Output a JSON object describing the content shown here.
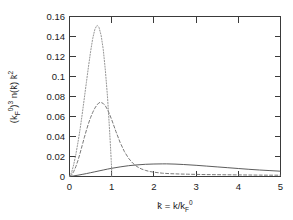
{
  "chart_data": {
    "type": "line",
    "title": "",
    "subtitle": "",
    "xlabel": "k̄ = k/k_F^0",
    "xlabel_parts": {
      "var": "k̄",
      "equals": " = k/k",
      "sub": "F",
      "sup": "0"
    },
    "ylabel": "(k_F^0)^3 n(k̄) k̄^2",
    "ylabel_parts": {
      "open": "(k",
      "sub1": "F",
      "sup1": "0",
      "close": ")",
      "sup2": "3",
      "mid": " n(k̄) k̄",
      "sup3": "2"
    },
    "xlim": [
      0,
      5
    ],
    "ylim": [
      0,
      0.16
    ],
    "xticks": [
      "0",
      "1",
      "2",
      "3",
      "4",
      "5"
    ],
    "xtick_values": [
      0,
      1,
      2,
      3,
      4,
      5
    ],
    "yticks": [
      "0",
      "0.02",
      "0.04",
      "0.06",
      "0.08",
      "0.1",
      "0.12",
      "0.14",
      "0.16"
    ],
    "ytick_values": [
      0,
      0.02,
      0.04,
      0.06,
      0.08,
      0.1,
      0.12,
      0.14,
      0.16
    ],
    "grid": false,
    "legend": "none",
    "series": [
      {
        "name": "dotted-curve",
        "style": "dotted",
        "color": "#8a8a8a",
        "peak_x": 0.66,
        "peak_y": 0.151,
        "x": [
          0.0,
          0.05,
          0.1,
          0.15,
          0.2,
          0.25,
          0.3,
          0.35,
          0.4,
          0.45,
          0.5,
          0.55,
          0.6,
          0.64,
          0.66,
          0.7,
          0.75,
          0.8,
          0.85,
          0.9,
          0.94,
          0.97,
          0.99,
          1.0,
          1.0
        ],
        "y": [
          0.0,
          0.004,
          0.012,
          0.022,
          0.034,
          0.047,
          0.062,
          0.078,
          0.094,
          0.11,
          0.125,
          0.138,
          0.147,
          0.1505,
          0.151,
          0.149,
          0.141,
          0.127,
          0.106,
          0.08,
          0.053,
          0.031,
          0.015,
          0.006,
          0.0
        ]
      },
      {
        "name": "dashed-curve",
        "style": "dashed",
        "color": "#6b6b6b",
        "peak_x": 0.7,
        "peak_y": 0.074,
        "x": [
          0.0,
          0.05,
          0.1,
          0.15,
          0.2,
          0.25,
          0.3,
          0.35,
          0.4,
          0.45,
          0.5,
          0.55,
          0.6,
          0.65,
          0.7,
          0.75,
          0.8,
          0.85,
          0.9,
          0.95,
          1.0,
          1.1,
          1.2,
          1.3,
          1.4,
          1.5,
          1.6,
          1.7,
          1.8,
          1.9,
          2.0,
          2.2,
          2.4,
          2.6,
          2.8,
          3.0,
          3.25,
          3.5,
          3.75,
          4.0,
          4.25,
          4.5,
          4.75,
          5.0
        ],
        "y": [
          0.0,
          0.0015,
          0.005,
          0.0098,
          0.016,
          0.0232,
          0.031,
          0.0388,
          0.0462,
          0.053,
          0.059,
          0.0641,
          0.0683,
          0.0715,
          0.0738,
          0.074,
          0.073,
          0.0706,
          0.067,
          0.0622,
          0.0568,
          0.045,
          0.034,
          0.025,
          0.0182,
          0.0133,
          0.0099,
          0.0076,
          0.0061,
          0.005,
          0.0043,
          0.0033,
          0.0028,
          0.0025,
          0.0023,
          0.0021,
          0.0019,
          0.0018,
          0.0017,
          0.0016,
          0.0015,
          0.0014,
          0.0013,
          0.0013
        ]
      },
      {
        "name": "solid-curve",
        "style": "solid",
        "color": "#4a4a4a",
        "peak_x": 2.3,
        "peak_y": 0.0126,
        "x": [
          0.0,
          0.1,
          0.2,
          0.3,
          0.4,
          0.5,
          0.6,
          0.7,
          0.8,
          0.9,
          1.0,
          1.2,
          1.4,
          1.6,
          1.8,
          2.0,
          2.2,
          2.3,
          2.5,
          2.7,
          3.0,
          3.25,
          3.5,
          3.75,
          4.0,
          4.25,
          4.5,
          4.75,
          5.0
        ],
        "y": [
          0.0,
          0.0006,
          0.0013,
          0.0021,
          0.0029,
          0.0038,
          0.0047,
          0.0056,
          0.0065,
          0.0074,
          0.0082,
          0.0096,
          0.0108,
          0.0116,
          0.0122,
          0.0125,
          0.01262,
          0.01263,
          0.0124,
          0.012,
          0.0112,
          0.0104,
          0.0096,
          0.0088,
          0.008,
          0.0072,
          0.0065,
          0.0059,
          0.0053
        ]
      }
    ]
  },
  "figure": {
    "background_color": "#ffffff",
    "frame_color": "#3a3a3a"
  }
}
